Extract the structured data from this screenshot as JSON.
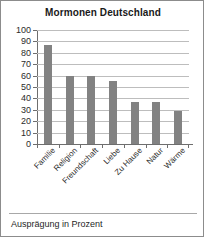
{
  "chart_data": {
    "type": "bar",
    "title": "Mormonen Deutschland",
    "categories": [
      "Familie",
      "Religion",
      "Freundschaft",
      "Liebe",
      "Zu Hause",
      "Natur",
      "Wärme"
    ],
    "values": [
      87,
      60,
      60,
      55,
      37,
      37,
      29
    ],
    "xlabel": "",
    "ylabel": "",
    "ylim": [
      0,
      100
    ],
    "ytick_step": 10,
    "yticks": [
      "100",
      "90",
      "80",
      "70",
      "60",
      "50",
      "40",
      "30",
      "20",
      "10",
      "0"
    ],
    "grid": true,
    "legend": false,
    "bar_color": "#828282",
    "gridline_color": "#bdbdbd",
    "axis_color": "#6e6e6e",
    "background_color": "#ffffff",
    "caption": "Ausprägung in Prozent"
  }
}
